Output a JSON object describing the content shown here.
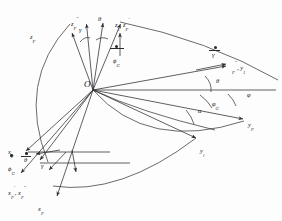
{
  "figure": {
    "type": "kinematic-axes-diagram",
    "origin_label": "O",
    "stroke_color": "#2b2b2b",
    "background": "#fdfdfd"
  },
  "labels": {
    "origin": "O",
    "z_F": "z",
    "z_F_sub": "F",
    "z_F_dblprime": "z",
    "z_F_dblprime_sub": "F",
    "z_F_dblprime_sup": "″",
    "gamma_top": "γ",
    "theta_top": "θ",
    "z1_zFprime": "z",
    "z1_sub": "1",
    "z1_comma": ", z",
    "zFprime_sub": "F",
    "zFprime_sup": "′",
    "phi_dot_G": "ϕ",
    "phi_dot_G_sub": "G",
    "gamma_dot": "γ",
    "y_F_dblprime_y1": "y",
    "y_F_dblprime_sub": "F",
    "y_F_dblprime_sup": "″",
    "y1_label": ", y",
    "y1_label_sub": "1",
    "theta_right": "θ",
    "phi_G": "φ",
    "phi_G_sub": "G",
    "phi": "φ",
    "alpha": "α",
    "y_F": "y",
    "y_F_sub": "F",
    "y_l": "y",
    "y_l_sub": "l",
    "x_F_left": "x",
    "x_F_left_sub": "F",
    "phi_dot_G_left": "ϕ",
    "phi_dot_G_left_sub": "G",
    "theta_dot_left": "θ",
    "gamma_left": "γ",
    "x_F_prime_dblprime": "x",
    "x_F_prime_sub": "F",
    "x_F_prime_sup": "′",
    "x_F_dbl_comma": ", x",
    "x_F_dbl_sub": "F",
    "x_F_dbl_sup": "″",
    "x_F_bottom": "x",
    "x_F_bottom_sub": "F"
  },
  "geometry": {
    "origin": {
      "x": 93,
      "y": 90
    },
    "rays_from_origin": [
      {
        "name": "z-axis-up-1",
        "to": {
          "x": 103,
          "y": 16
        }
      },
      {
        "name": "z-axis-up-2",
        "to": {
          "x": 121,
          "y": 18
        }
      },
      {
        "name": "z-axis-up-3",
        "to": {
          "x": 88,
          "y": 22
        }
      },
      {
        "name": "y-axis-right-horizontal",
        "to": {
          "x": 272,
          "y": 90
        }
      },
      {
        "name": "y-axis-upper-right",
        "to": {
          "x": 238,
          "y": 60
        }
      },
      {
        "name": "y-axis-lower-right-1",
        "to": {
          "x": 245,
          "y": 120
        }
      },
      {
        "name": "y-axis-lower-right-2",
        "to": {
          "x": 200,
          "y": 140
        }
      },
      {
        "name": "x-axis-lower-left-1",
        "to": {
          "x": 30,
          "y": 150
        }
      },
      {
        "name": "x-axis-lower-left-2",
        "to": {
          "x": 22,
          "y": 176
        }
      },
      {
        "name": "x-axis-lower-left-3",
        "to": {
          "x": 60,
          "y": 198
        }
      },
      {
        "name": "x-axis-lower-left-4",
        "to": {
          "x": 15,
          "y": 160
        }
      }
    ],
    "arcs": [
      {
        "name": "great-arc-left",
        "d": "M 62 20 Q 18 78 44 160"
      },
      {
        "name": "great-arc-bottom",
        "d": "M 93 90 Q 150 150 246 122"
      },
      {
        "name": "great-arc-top-right",
        "d": "M 120 20 Q 200 40 276 78"
      }
    ]
  }
}
